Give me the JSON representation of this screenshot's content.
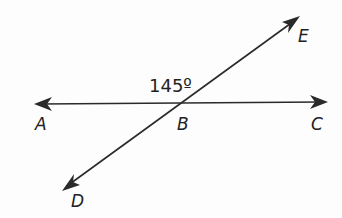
{
  "diagram": {
    "type": "intersecting lines",
    "angle_label": "145º",
    "points": {
      "A": "A",
      "B": "B",
      "C": "C",
      "D": "D",
      "E": "E"
    },
    "lines": [
      {
        "name": "line AC",
        "from": "A",
        "to": "C"
      },
      {
        "name": "line DE",
        "from": "D",
        "to": "E"
      }
    ],
    "intersection": "B",
    "stroke_color": "#2a2a2a"
  }
}
